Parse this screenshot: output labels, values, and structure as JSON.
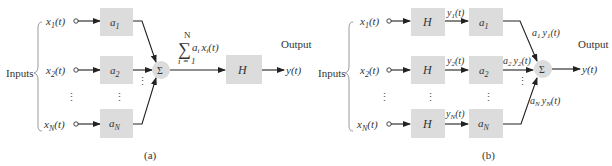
{
  "colors": {
    "block_fill": "#dcdcdc",
    "line": "#222222",
    "text": "#333333",
    "brace": "#999999"
  },
  "diagram_a": {
    "caption": "(a)",
    "inputs_label": "Inputs",
    "output_label": "Output",
    "inputs": [
      {
        "name": "x",
        "sub": "1",
        "arg": "(t)"
      },
      {
        "name": "x",
        "sub": "2",
        "arg": "(t)"
      },
      {
        "name": "x",
        "sub": "N",
        "arg": "(t)"
      }
    ],
    "gains": [
      {
        "name": "a",
        "sub": "1"
      },
      {
        "name": "a",
        "sub": "2"
      },
      {
        "name": "a",
        "sub": "N"
      }
    ],
    "vdots": "⋮",
    "summer_symbol": "Σ",
    "sum_expression": {
      "upper": "N",
      "sigma": "∑",
      "term": "a",
      "term_sub": "i",
      "term2": "x",
      "term2_sub": "i",
      "arg": "(t)",
      "lower": "i = 1"
    },
    "system_block": "H",
    "output": "y(t)"
  },
  "diagram_b": {
    "caption": "(b)",
    "inputs_label": "Inputs",
    "output_label": "Output",
    "inputs": [
      {
        "name": "x",
        "sub": "1",
        "arg": "(t)"
      },
      {
        "name": "x",
        "sub": "2",
        "arg": "(t)"
      },
      {
        "name": "x",
        "sub": "N",
        "arg": "(t)"
      }
    ],
    "system_blocks": [
      "H",
      "H",
      "H"
    ],
    "intermediate": [
      {
        "name": "y",
        "sub": "1",
        "arg": "(t)"
      },
      {
        "name": "y",
        "sub": "2",
        "arg": "(t)"
      },
      {
        "name": "y",
        "sub": "N",
        "arg": "(t)"
      }
    ],
    "gains": [
      {
        "name": "a",
        "sub": "1"
      },
      {
        "name": "a",
        "sub": "2"
      },
      {
        "name": "a",
        "sub": "N"
      }
    ],
    "weighted": [
      {
        "a": "a",
        "a_sub": "1",
        "y": "y",
        "y_sub": "1",
        "arg": "(t)"
      },
      {
        "a": "a",
        "a_sub": "2",
        "y": "y",
        "y_sub": "2",
        "arg": "(t)"
      },
      {
        "a": "a",
        "a_sub": "N",
        "y": "y",
        "y_sub": "N",
        "arg": "(t)"
      }
    ],
    "vdots": "⋮",
    "summer_symbol": "Σ",
    "output": "y(t)"
  }
}
